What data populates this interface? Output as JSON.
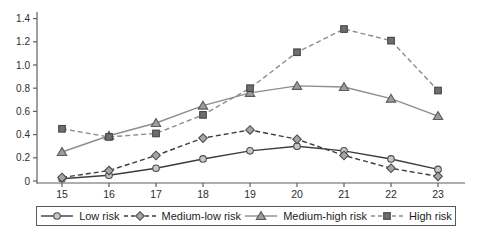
{
  "chart_data": {
    "type": "line",
    "title": "",
    "xlabel": "",
    "ylabel": "",
    "x": [
      15,
      16,
      17,
      18,
      19,
      20,
      21,
      22,
      23
    ],
    "ylim": [
      0,
      1.4
    ],
    "ytick_labels": [
      "0",
      "0.2",
      "0.4",
      "0.6",
      "0.8",
      "1.0",
      "1.2",
      "1.4"
    ],
    "grid": false,
    "legend_position": "bottom",
    "axis_color": "#5f5f5f",
    "series": [
      {
        "name": "Low risk",
        "marker": "circle",
        "line": "solid",
        "color": "#3c3c3c",
        "marker_fill": "#c7c7c7",
        "marker_stroke": "#4d4d4d",
        "values": [
          0.02,
          0.05,
          0.11,
          0.19,
          0.26,
          0.3,
          0.26,
          0.19,
          0.1
        ]
      },
      {
        "name": "Medium-low risk",
        "marker": "diamond",
        "line": "dashed",
        "color": "#3c3c3c",
        "marker_fill": "#a6a6a6",
        "marker_stroke": "#4d4d4d",
        "values": [
          0.03,
          0.09,
          0.22,
          0.37,
          0.44,
          0.36,
          0.22,
          0.11,
          0.04
        ]
      },
      {
        "name": "Medium-high risk",
        "marker": "triangle",
        "line": "solid",
        "color": "#8d8d8d",
        "marker_fill": "#9d9d9d",
        "marker_stroke": "#5c5c5c",
        "values": [
          0.25,
          0.39,
          0.5,
          0.65,
          0.76,
          0.82,
          0.81,
          0.71,
          0.56
        ]
      },
      {
        "name": "High risk",
        "marker": "square",
        "line": "dashed",
        "color": "#8d8d8d",
        "marker_fill": "#6e6e6e",
        "marker_stroke": "#454545",
        "values": [
          0.45,
          0.38,
          0.41,
          0.57,
          0.8,
          1.11,
          1.31,
          1.21,
          0.78
        ]
      }
    ]
  }
}
